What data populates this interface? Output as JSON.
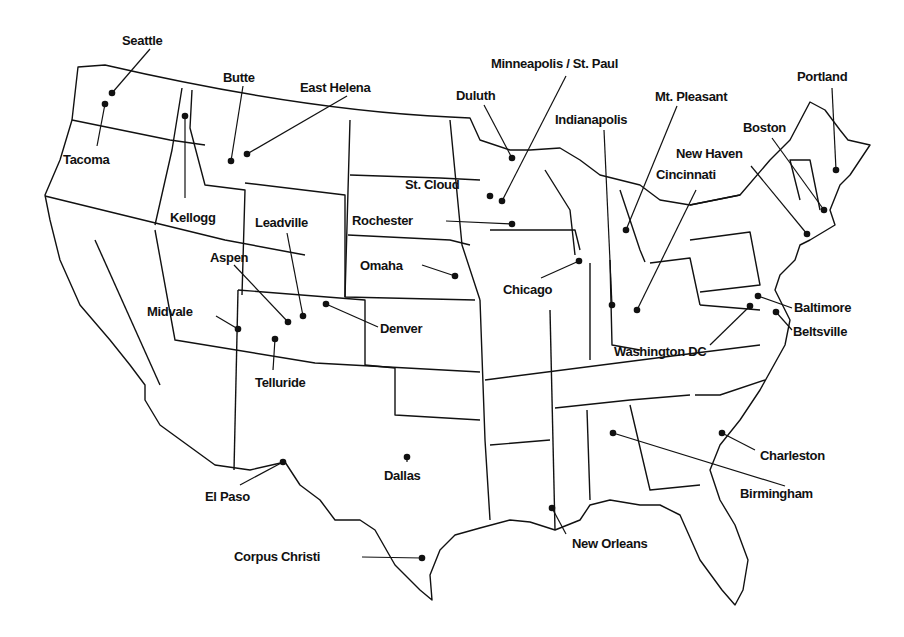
{
  "map": {
    "title": "",
    "colors": {
      "background": "#ffffff",
      "line": "#111111"
    },
    "cities": [
      {
        "name": "Seattle",
        "dot": [
          112,
          93
        ],
        "label": [
          122,
          33
        ],
        "anchor": [
          150,
          49
        ]
      },
      {
        "name": "Tacoma",
        "dot": [
          105,
          104
        ],
        "label": [
          63,
          152
        ],
        "anchor": [
          97,
          146
        ]
      },
      {
        "name": "Kellogg",
        "dot": [
          185,
          116
        ],
        "label": [
          170,
          210
        ],
        "anchor": [
          185,
          198
        ]
      },
      {
        "name": "Butte",
        "dot": [
          231,
          161
        ],
        "label": [
          223,
          70
        ],
        "anchor": [
          243,
          86
        ]
      },
      {
        "name": "East Helena",
        "dot": [
          247,
          154
        ],
        "label": [
          300,
          80
        ],
        "anchor": [
          347,
          96
        ]
      },
      {
        "name": "Leadville",
        "dot": [
          303,
          316
        ],
        "label": [
          255,
          215
        ],
        "anchor": [
          287,
          233
        ]
      },
      {
        "name": "Aspen",
        "dot": [
          288,
          322
        ],
        "label": [
          210,
          250
        ],
        "anchor": [
          234,
          265
        ]
      },
      {
        "name": "Midvale",
        "dot": [
          238,
          329
        ],
        "label": [
          147,
          304
        ],
        "anchor": [
          216,
          316
        ]
      },
      {
        "name": "Denver",
        "dot": [
          326,
          304
        ],
        "label": [
          380,
          321
        ],
        "anchor": [
          378,
          327
        ]
      },
      {
        "name": "Telluride",
        "dot": [
          275,
          339
        ],
        "label": [
          255,
          375
        ],
        "anchor": [
          273,
          370
        ]
      },
      {
        "name": "El Paso",
        "dot": [
          283,
          462
        ],
        "label": [
          205,
          489
        ],
        "anchor": [
          240,
          485
        ]
      },
      {
        "name": "Dallas",
        "dot": [
          407,
          457
        ],
        "label": [
          384,
          468
        ],
        "anchor": [
          407,
          462
        ]
      },
      {
        "name": "Corpus Christi",
        "dot": [
          422,
          558
        ],
        "label": [
          234,
          549
        ],
        "anchor": [
          362,
          557
        ]
      },
      {
        "name": "Rochester",
        "dot": [
          512,
          224
        ],
        "label": [
          352,
          213
        ],
        "anchor": [
          446,
          221
        ]
      },
      {
        "name": "St. Cloud",
        "dot": [
          490,
          196
        ],
        "label": [
          405,
          177
        ],
        "anchor": [
          490,
          196
        ]
      },
      {
        "name": "Omaha",
        "dot": [
          455,
          276
        ],
        "label": [
          360,
          258
        ],
        "anchor": [
          422,
          265
        ]
      },
      {
        "name": "Duluth",
        "dot": [
          512,
          158
        ],
        "label": [
          456,
          88
        ],
        "anchor": [
          484,
          105
        ]
      },
      {
        "name": "Minneapolis / St. Paul",
        "dot": [
          502,
          201
        ],
        "label": [
          491,
          56
        ],
        "anchor": [
          566,
          76
        ]
      },
      {
        "name": "Chicago",
        "dot": [
          579,
          261
        ],
        "label": [
          503,
          282
        ],
        "anchor": [
          541,
          278
        ]
      },
      {
        "name": "Indianapolis",
        "dot": [
          612,
          305
        ],
        "label": [
          555,
          112
        ],
        "anchor": [
          604,
          130
        ]
      },
      {
        "name": "Mt. Pleasant",
        "dot": [
          626,
          230
        ],
        "label": [
          655,
          89
        ],
        "anchor": [
          677,
          106
        ]
      },
      {
        "name": "Cincinnati",
        "dot": [
          637,
          310
        ],
        "label": [
          656,
          167
        ],
        "anchor": [
          696,
          190
        ]
      },
      {
        "name": "New Haven",
        "dot": [
          807,
          234
        ],
        "label": [
          676,
          146
        ],
        "anchor": [
          751,
          166
        ]
      },
      {
        "name": "Boston",
        "dot": [
          824,
          210
        ],
        "label": [
          743,
          120
        ],
        "anchor": [
          772,
          138
        ]
      },
      {
        "name": "Portland",
        "dot": [
          836,
          170
        ],
        "label": [
          797,
          69
        ],
        "anchor": [
          832,
          88
        ]
      },
      {
        "name": "Baltimore",
        "dot": [
          758,
          296
        ],
        "label": [
          794,
          300
        ],
        "anchor": [
          792,
          308
        ]
      },
      {
        "name": "Beltsville",
        "dot": [
          776,
          312
        ],
        "label": [
          793,
          324
        ],
        "anchor": [
          792,
          330
        ]
      },
      {
        "name": "Washington DC",
        "dot": [
          750,
          306
        ],
        "label": [
          614,
          344
        ],
        "anchor": [
          710,
          345
        ]
      },
      {
        "name": "Charleston",
        "dot": [
          722,
          433
        ],
        "label": [
          760,
          448
        ],
        "anchor": [
          755,
          450
        ]
      },
      {
        "name": "Birmingham",
        "dot": [
          613,
          433
        ],
        "label": [
          740,
          486
        ],
        "anchor": [
          785,
          486
        ]
      },
      {
        "name": "New Orleans",
        "dot": [
          552,
          508
        ],
        "label": [
          572,
          536
        ],
        "anchor": [
          566,
          534
        ]
      }
    ]
  }
}
